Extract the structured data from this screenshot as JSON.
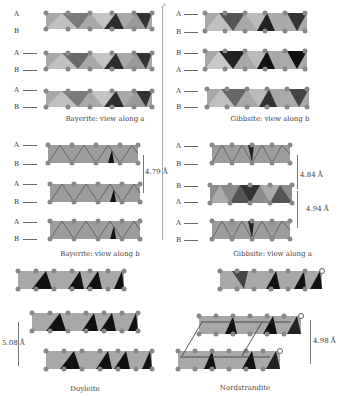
{
  "figure": {
    "axis_label": "z",
    "panels": [
      {
        "id": "bayerite-a",
        "caption": "Bayerite: view along a",
        "layer_labels": [
          "A",
          "B",
          "A",
          "B",
          "A",
          "B"
        ],
        "distances": []
      },
      {
        "id": "gibbsite-b",
        "caption": "Gibbsite: view along b",
        "layer_labels": [
          "A",
          "B",
          "B",
          "A",
          "A",
          "B"
        ],
        "distances": []
      },
      {
        "id": "bayerite-b",
        "caption": "Bayerite: view along b",
        "layer_labels": [
          "A",
          "B",
          "A",
          "B",
          "A",
          "B"
        ],
        "distances": [
          "4.79 Å"
        ]
      },
      {
        "id": "gibbsite-a",
        "caption": "Gibbsite: view along a",
        "layer_labels": [
          "A",
          "B",
          "B",
          "A",
          "A",
          "B"
        ],
        "distances": [
          "4.84 Å",
          "4.94 Å"
        ]
      },
      {
        "id": "doyleite",
        "caption": "Doyleite",
        "layer_labels": [],
        "distances": [
          "5.08 Å"
        ]
      },
      {
        "id": "nordstrandite",
        "caption": "Nordstrandite",
        "layer_labels": [],
        "distances": [
          "4.98 Å"
        ]
      }
    ],
    "colors": {
      "poly_light": "#b8b8b8",
      "poly_mid": "#8a8a8a",
      "poly_dark": "#3a3a3a",
      "atom": "#888888",
      "text": "#444444"
    }
  }
}
